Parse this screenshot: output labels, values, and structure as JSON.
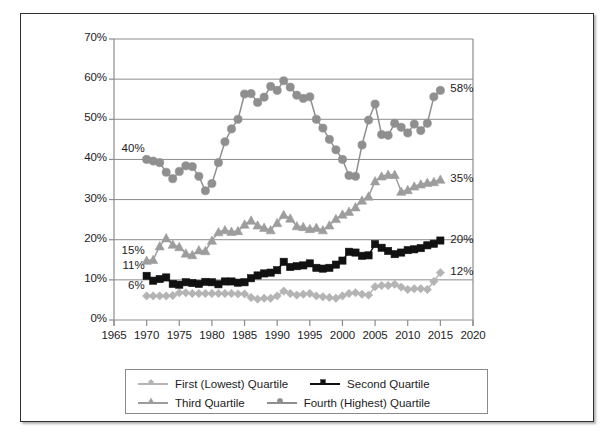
{
  "chart_data": {
    "type": "line",
    "title": "",
    "xlabel": "",
    "ylabel": "",
    "xlim": [
      1965,
      2020
    ],
    "ylim": [
      0,
      0.7
    ],
    "grid": true,
    "legend_position": "bottom",
    "x_ticks": [
      "1965",
      "1970",
      "1975",
      "1980",
      "1985",
      "1990",
      "1995",
      "2000",
      "2005",
      "2010",
      "2015",
      "2020"
    ],
    "x_tick_values": [
      1965,
      1970,
      1975,
      1980,
      1985,
      1990,
      1995,
      2000,
      2005,
      2010,
      2015,
      2020
    ],
    "y_ticks": [
      "0%",
      "10%",
      "20%",
      "30%",
      "40%",
      "50%",
      "60%",
      "70%"
    ],
    "y_tick_values": [
      0,
      10,
      20,
      30,
      40,
      50,
      60,
      70
    ],
    "series": [
      {
        "name": "First (Lowest) Quartile",
        "marker": "diamond",
        "color": "#b4b4b4",
        "start_label": "6%",
        "end_label": "12%",
        "x": [
          1970,
          1971,
          1972,
          1973,
          1974,
          1975,
          1976,
          1977,
          1978,
          1979,
          1980,
          1981,
          1982,
          1983,
          1984,
          1985,
          1986,
          1987,
          1988,
          1989,
          1990,
          1991,
          1992,
          1993,
          1994,
          1995,
          1996,
          1997,
          1998,
          1999,
          2000,
          2001,
          2002,
          2003,
          2004,
          2005,
          2006,
          2007,
          2008,
          2009,
          2010,
          2011,
          2012,
          2013,
          2014,
          2015
        ],
        "values": [
          6.0,
          6.0,
          6.0,
          6.0,
          6.1,
          6.8,
          6.8,
          6.6,
          6.6,
          6.6,
          6.6,
          6.6,
          6.6,
          6.6,
          6.5,
          6.5,
          5.6,
          5.2,
          5.4,
          5.4,
          6.0,
          7.2,
          6.6,
          6.2,
          6.4,
          6.6,
          6.0,
          5.8,
          5.6,
          5.4,
          6.0,
          6.6,
          6.8,
          6.4,
          6.2,
          8.3,
          8.6,
          8.6,
          8.9,
          8.2,
          7.6,
          7.8,
          7.8,
          7.6,
          9.6,
          11.8
        ]
      },
      {
        "name": "Second Quartile",
        "marker": "square",
        "color": "#111111",
        "start_label": "11%",
        "end_label": "20%",
        "x": [
          1970,
          1971,
          1972,
          1973,
          1974,
          1975,
          1976,
          1977,
          1978,
          1979,
          1980,
          1981,
          1982,
          1983,
          1984,
          1985,
          1986,
          1987,
          1988,
          1989,
          1990,
          1991,
          1992,
          1993,
          1994,
          1995,
          1996,
          1997,
          1998,
          1999,
          2000,
          2001,
          2002,
          2003,
          2004,
          2005,
          2006,
          2007,
          2008,
          2009,
          2010,
          2011,
          2012,
          2013,
          2014,
          2015
        ],
        "values": [
          11.0,
          9.8,
          10.2,
          10.6,
          9.0,
          8.8,
          9.4,
          9.2,
          9.0,
          9.5,
          9.4,
          8.9,
          9.6,
          9.6,
          9.3,
          9.4,
          10.4,
          11.1,
          11.6,
          11.8,
          12.4,
          14.5,
          13.2,
          13.4,
          13.6,
          14.1,
          13.0,
          12.8,
          13.0,
          13.8,
          14.8,
          17.0,
          16.8,
          16.0,
          16.1,
          18.9,
          18.0,
          17.2,
          16.4,
          16.8,
          17.4,
          17.6,
          17.9,
          18.6,
          19.0,
          19.8
        ]
      },
      {
        "name": "Third Quartile",
        "marker": "triangle",
        "color": "#9d9d9d",
        "start_label": "15%",
        "end_label": "35%",
        "x": [
          1970,
          1971,
          1972,
          1973,
          1974,
          1975,
          1976,
          1977,
          1978,
          1979,
          1980,
          1981,
          1982,
          1983,
          1984,
          1985,
          1986,
          1987,
          1988,
          1989,
          1990,
          1991,
          1992,
          1993,
          1994,
          1995,
          1996,
          1997,
          1998,
          1999,
          2000,
          2001,
          2002,
          2003,
          2004,
          2005,
          2006,
          2007,
          2008,
          2009,
          2010,
          2011,
          2012,
          2013,
          2014,
          2015
        ],
        "values": [
          14.8,
          15.0,
          18.4,
          20.4,
          18.8,
          18.2,
          16.6,
          16.2,
          17.4,
          17.2,
          19.8,
          21.9,
          22.4,
          22.0,
          22.2,
          23.8,
          24.8,
          23.6,
          23.0,
          22.4,
          24.2,
          26.2,
          25.3,
          23.4,
          23.2,
          22.7,
          23.0,
          22.4,
          23.6,
          25.2,
          26.3,
          27.0,
          28.1,
          29.8,
          30.8,
          34.6,
          35.8,
          36.2,
          36.2,
          32.0,
          32.4,
          33.3,
          33.8,
          34.2,
          34.4,
          35.0
        ]
      },
      {
        "name": "Fourth (Highest) Quartile",
        "marker": "circle",
        "color": "#8f8f8f",
        "start_label": "40%",
        "end_label": "58%",
        "x": [
          1970,
          1971,
          1972,
          1973,
          1974,
          1975,
          1976,
          1977,
          1978,
          1979,
          1980,
          1981,
          1982,
          1983,
          1984,
          1985,
          1986,
          1987,
          1988,
          1989,
          1990,
          1991,
          1992,
          1993,
          1994,
          1995,
          1996,
          1997,
          1998,
          1999,
          2000,
          2001,
          2002,
          2003,
          2004,
          2005,
          2006,
          2007,
          2008,
          2009,
          2010,
          2011,
          2012,
          2013,
          2014,
          2015
        ],
        "values": [
          40.0,
          39.6,
          39.2,
          36.8,
          35.2,
          37.0,
          38.4,
          38.2,
          35.8,
          32.2,
          34.0,
          39.2,
          44.4,
          47.6,
          50.0,
          56.3,
          56.4,
          54.2,
          55.5,
          58.2,
          57.2,
          59.6,
          58.0,
          56.0,
          55.2,
          55.6,
          50.0,
          47.8,
          45.0,
          42.4,
          40.0,
          36.0,
          35.8,
          43.6,
          49.8,
          53.8,
          46.2,
          46.0,
          49.0,
          48.0,
          46.6,
          48.8,
          47.2,
          49.0,
          55.6,
          57.2
        ]
      }
    ]
  },
  "legend": {
    "items": [
      {
        "label": "First (Lowest) Quartile"
      },
      {
        "label": "Second Quartile"
      },
      {
        "label": "Third Quartile"
      },
      {
        "label": "Fourth (Highest) Quartile"
      }
    ]
  }
}
